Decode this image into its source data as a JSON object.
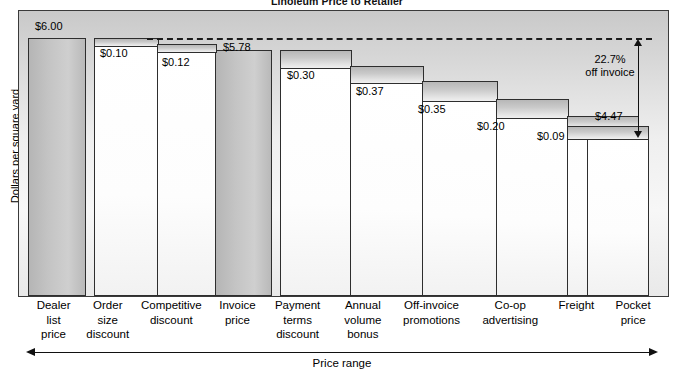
{
  "chart_title": "Linoleum Price to Retailer",
  "axis": {
    "ylabel": "Dollars per square yard",
    "range_label": "Price range"
  },
  "annotations": {
    "pct_line1": "22.7%",
    "pct_line2": "off invoice",
    "pocket_value": "$4.47"
  },
  "categories": [
    "Dealer\nlist\nprice",
    "Order\nsize\ndiscount",
    "Competitive\ndiscount",
    "Invoice\nprice",
    "Payment\nterms\ndiscount",
    "Annual\nvolume\nbonus",
    "Off-invoice\npromotions",
    "Co-op\nadvertising",
    "Freight",
    "Pocket\nprice"
  ],
  "category_labels": {
    "c0": "Dealer list price",
    "c1": "Order size discount",
    "c2": "Competitive discount",
    "c3": "Invoice price",
    "c4": "Payment terms discount",
    "c5": "Annual volume bonus",
    "c6": "Off-invoice promotions",
    "c7": "Co-op advertising",
    "c8": "Freight",
    "c9": "Pocket price"
  },
  "values": {
    "v0": "$6.00",
    "v1": "$0.10",
    "v2": "$0.12",
    "v3": "$5.78",
    "v4": "$0.30",
    "v5": "$0.37",
    "v6": "$0.35",
    "v7": "$0.20",
    "v8": "$0.09",
    "v9": "$4.47"
  },
  "chart_data": {
    "type": "bar",
    "subtype": "waterfall",
    "title": "Linoleum Price to Retailer",
    "xlabel": "Price range",
    "ylabel": "Dollars per square yard",
    "grid": false,
    "legend": "none",
    "ylim": [
      0,
      6.35
    ],
    "categories": [
      "Dealer list price",
      "Order size discount",
      "Competitive discount",
      "Invoice price",
      "Payment terms discount",
      "Annual volume bonus",
      "Off-invoice promotions",
      "Co-op advertising",
      "Freight",
      "Pocket price"
    ],
    "values": [
      6.0,
      0.1,
      0.12,
      5.78,
      0.3,
      0.37,
      0.35,
      0.2,
      0.09,
      4.47
    ],
    "data_labels": [
      "$6.00",
      "$0.10",
      "$0.12",
      "$5.78",
      "$0.30",
      "$0.37",
      "$0.35",
      "$0.20",
      "$0.09",
      "$4.47"
    ],
    "bar_kinds": [
      "total",
      "decrement",
      "decrement",
      "total",
      "decrement",
      "decrement",
      "decrement",
      "decrement",
      "decrement",
      "total"
    ],
    "running_top": [
      6.0,
      6.0,
      5.9,
      5.78,
      5.78,
      5.48,
      5.11,
      4.76,
      4.56,
      4.47
    ],
    "running_bottom": [
      0.0,
      5.9,
      5.78,
      0.0,
      5.48,
      5.11,
      4.76,
      4.56,
      4.47,
      0.0
    ],
    "reference_line": {
      "label": "Invoice price level",
      "value": 5.78,
      "style": "dashed"
    },
    "annotations": [
      {
        "text": "22.7% off invoice",
        "refers_to": "total discount from invoice price to pocket price"
      },
      {
        "text": "$4.47",
        "refers_to": "pocket price"
      }
    ]
  }
}
